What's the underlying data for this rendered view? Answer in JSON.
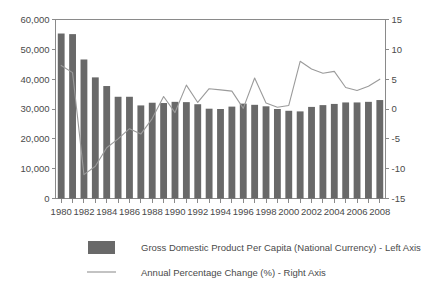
{
  "chart_data": {
    "type": "bar",
    "title": "",
    "subtitle": "",
    "xlabel": "",
    "ylabel": "",
    "grid": false,
    "legend_position": "bottom",
    "categories": [
      "1980",
      "1981",
      "1982",
      "1983",
      "1984",
      "1985",
      "1986",
      "1987",
      "1988",
      "1989",
      "1990",
      "1991",
      "1992",
      "1993",
      "1994",
      "1995",
      "1996",
      "1997",
      "1998",
      "1999",
      "2000",
      "2001",
      "2002",
      "2003",
      "2004",
      "2005",
      "2006",
      "2007",
      "2008"
    ],
    "x_tick_labels": [
      "1980",
      "1982",
      "1984",
      "1986",
      "1988",
      "1990",
      "1992",
      "1994",
      "1996",
      "1998",
      "2000",
      "2002",
      "2004",
      "2006",
      "2008"
    ],
    "left_axis": {
      "label": "Gross Domestic Product Per Capita (National Currency)",
      "ylim": [
        0,
        60000
      ],
      "ticks": [
        0,
        10000,
        20000,
        30000,
        40000,
        50000,
        60000
      ],
      "tick_labels": [
        "0",
        "10,000",
        "20,000",
        "30,000",
        "40,000",
        "50,000",
        "60,000"
      ]
    },
    "right_axis": {
      "label": "Annual Percentage Change (%)",
      "ylim": [
        -15,
        15
      ],
      "ticks": [
        -15,
        -10,
        -5,
        0,
        5,
        10,
        15
      ],
      "tick_labels": [
        "-15",
        "-10",
        "-5",
        "0",
        "5",
        "10",
        "15"
      ]
    },
    "series": [
      {
        "name": "Gross Domestic Product Per Capita (National Currency) - Left Axis",
        "type": "bar",
        "axis": "left",
        "color": "#696969",
        "values": [
          55300,
          55100,
          46600,
          40600,
          37700,
          34100,
          34100,
          31200,
          32100,
          32000,
          32400,
          32300,
          31600,
          30100,
          30000,
          30800,
          31800,
          31400,
          30900,
          30000,
          29400,
          29200,
          30700,
          31300,
          31700,
          32200,
          32200,
          32400,
          33000
        ]
      },
      {
        "name": "Annual Percentage Change (%) - Right Axis",
        "type": "line",
        "axis": "right",
        "color": "#9b9b9b",
        "values": [
          7.3,
          6.1,
          -11.0,
          -9.6,
          -6.5,
          -5.0,
          -3.3,
          -4.2,
          -1.6,
          2.1,
          -0.6,
          4.0,
          1.1,
          3.4,
          3.2,
          3.0,
          0.1,
          5.2,
          1.0,
          0.3,
          0.6,
          8.0,
          6.7,
          6.0,
          6.3,
          3.6,
          3.1,
          3.8,
          5.0
        ]
      }
    ],
    "legend": [
      {
        "marker": "square",
        "text": "Gross Domestic Product Per Capita (National Currency) - Left Axis"
      },
      {
        "marker": "line",
        "text": "Annual Percentage Change (%) - Right Axis"
      }
    ]
  }
}
